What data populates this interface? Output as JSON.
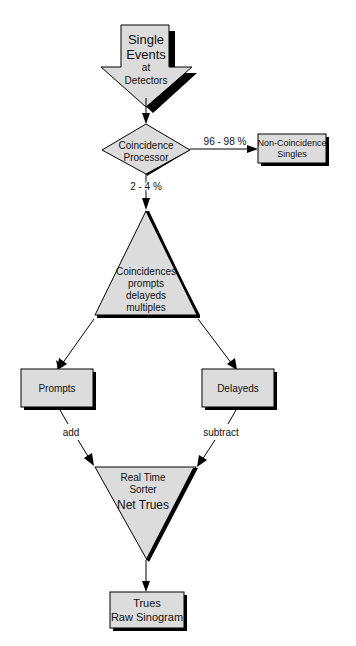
{
  "diagram": {
    "colors": {
      "fill": "#dcdcdc",
      "stroke": "#000000",
      "shadow": "#000000",
      "background": "#ffffff"
    },
    "nodes": {
      "single_events": {
        "shape": "down-arrow",
        "lines": [
          "Single",
          "Events",
          "at",
          "Detectors"
        ]
      },
      "coincidence_processor": {
        "shape": "diamond",
        "lines": [
          "Coincidence",
          "Processor"
        ]
      },
      "non_coincidence": {
        "shape": "rectangle",
        "lines": [
          "Non-Coincidence",
          "Singles"
        ]
      },
      "coincidences": {
        "shape": "triangle-up",
        "lines": [
          "Coincidences",
          "prompts",
          "delayeds",
          "multiples"
        ]
      },
      "prompts": {
        "shape": "rectangle",
        "lines": [
          "Prompts"
        ]
      },
      "delayeds": {
        "shape": "rectangle",
        "lines": [
          "Delayeds"
        ]
      },
      "sorter": {
        "shape": "triangle-down",
        "lines": [
          "Real Time",
          "Sorter",
          "Net Trues"
        ]
      },
      "trues": {
        "shape": "rectangle",
        "lines": [
          "Trues",
          "Raw Sinogram"
        ]
      }
    },
    "edges": {
      "to_non_coincidence": "96 - 98 %",
      "to_coincidences": "2 - 4 %",
      "prompts_to_sorter": "add",
      "delayeds_to_sorter": "subtract"
    }
  }
}
